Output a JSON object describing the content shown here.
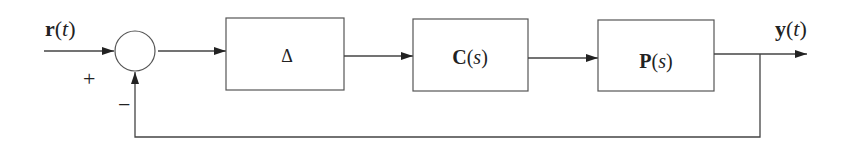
{
  "diagram": {
    "type": "feedback-control-block-diagram",
    "input": {
      "symbol": "r",
      "arg": "t"
    },
    "output": {
      "symbol": "y",
      "arg": "t"
    },
    "summing_junction": {
      "plus_sign": "+",
      "minus_sign": "−"
    },
    "blocks": [
      {
        "id": "delta",
        "label": "Δ"
      },
      {
        "id": "controller",
        "symbol": "C",
        "arg": "s"
      },
      {
        "id": "plant",
        "symbol": "P",
        "arg": "s"
      }
    ],
    "connections": [
      "r(t) → summing junction (+)",
      "summing junction → Δ",
      "Δ → C(s)",
      "C(s) → P(s)",
      "P(s) → y(t)",
      "y(t) → summing junction (−) feedback"
    ],
    "colors": {
      "line": "#444444",
      "text": "#222222",
      "background": "#ffffff"
    }
  }
}
